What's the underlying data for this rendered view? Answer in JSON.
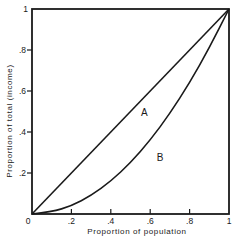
{
  "chart_data": {
    "type": "line",
    "title": "",
    "xlabel": "Proportion of population",
    "ylabel": "Proportion of total (income)",
    "xlim": [
      0,
      1
    ],
    "ylim": [
      0,
      1
    ],
    "grid": false,
    "legend": null,
    "x_ticks": [
      {
        "value": 0,
        "label": "0"
      },
      {
        "value": 0.2,
        "label": ".2"
      },
      {
        "value": 0.4,
        "label": ".4"
      },
      {
        "value": 0.6,
        "label": ".6"
      },
      {
        "value": 0.8,
        "label": ".8"
      },
      {
        "value": 1,
        "label": "1"
      }
    ],
    "y_ticks": [
      {
        "value": 0.2,
        "label": ".2"
      },
      {
        "value": 0.4,
        "label": ".4"
      },
      {
        "value": 0.6,
        "label": ".6"
      },
      {
        "value": 0.8,
        "label": ".8"
      },
      {
        "value": 1,
        "label": "1"
      }
    ],
    "series": [
      {
        "name": "Line of equality",
        "x": [
          0,
          1
        ],
        "y": [
          0,
          1
        ]
      },
      {
        "name": "Lorenz curve",
        "x": [
          0,
          0.1,
          0.2,
          0.3,
          0.4,
          0.5,
          0.6,
          0.7,
          0.8,
          0.9,
          1
        ],
        "y": [
          0,
          0.01,
          0.04,
          0.09,
          0.16,
          0.25,
          0.36,
          0.49,
          0.64,
          0.81,
          1
        ]
      }
    ],
    "annotations": [
      {
        "text": "A",
        "x": 0.57,
        "y": 0.48,
        "meaning": "area between line of equality and Lorenz curve"
      },
      {
        "text": "B",
        "x": 0.65,
        "y": 0.26,
        "meaning": "area below Lorenz curve"
      }
    ]
  }
}
